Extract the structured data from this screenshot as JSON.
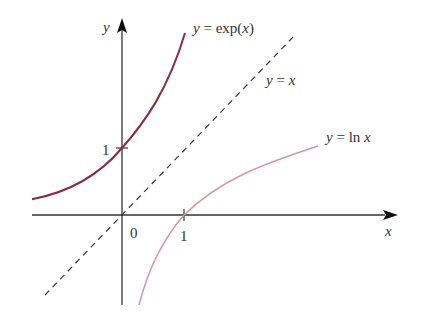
{
  "figure": {
    "axes": {
      "x_label": "x",
      "y_label": "y",
      "origin_label": "0"
    },
    "ticks": {
      "x_one": "1",
      "y_one": "1"
    },
    "curves": [
      {
        "name": "exp",
        "label_lhs": "y",
        "label_rhs": " = exp(",
        "label_var": "x",
        "label_close": ")",
        "color": "#8b2a45"
      },
      {
        "name": "identity",
        "label_lhs": "y",
        "label_eq": " = ",
        "label_var": "x",
        "style": "dashed",
        "color": "#333333"
      },
      {
        "name": "ln",
        "label_lhs": "y",
        "label_rhs": " = ln ",
        "label_var": "x",
        "color": "#d995a5"
      }
    ]
  }
}
